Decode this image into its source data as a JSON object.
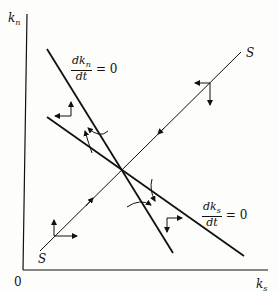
{
  "diagram": {
    "type": "phase-diagram",
    "axes": {
      "y_label": "k",
      "y_label_sub": "n",
      "x_label": "k",
      "x_label_sub": "s",
      "origin_label": "0"
    },
    "loci": [
      {
        "id": "dkn-dt-zero",
        "numerator": "dk",
        "numerator_sub": "n",
        "denominator": "dt",
        "equals": "= 0",
        "description": "steep downward-sloping line"
      },
      {
        "id": "dks-dt-zero",
        "numerator": "dk",
        "numerator_sub": "s",
        "denominator": "dt",
        "equals": "= 0",
        "description": "flatter downward-sloping line"
      }
    ],
    "saddle_path": {
      "label_top": "S",
      "label_bottom": "S",
      "description": "upward-sloping stable arm through the steady state"
    },
    "direction_arrows": [
      {
        "region": "upper-left",
        "horizontal": "left",
        "vertical": "up"
      },
      {
        "region": "upper-right",
        "horizontal": "left",
        "vertical": "down"
      },
      {
        "region": "lower-left",
        "horizontal": "right",
        "vertical": "up"
      },
      {
        "region": "lower-right",
        "horizontal": "right",
        "vertical": "down"
      }
    ],
    "colors": {
      "line": "#111111",
      "background": "#fdfdfb"
    }
  }
}
